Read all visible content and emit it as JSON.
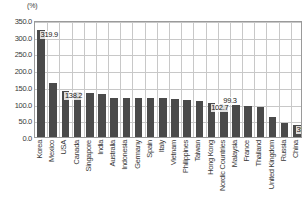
{
  "chart_data": {
    "type": "bar",
    "title": "",
    "subtitle": "",
    "xlabel": "",
    "ylabel": "(%)",
    "unit_label": "(%)",
    "ylim": [
      0.0,
      350.0
    ],
    "ytick_step": 50.0,
    "ytick_labels": [
      "350.0",
      "300.0",
      "250.0",
      "200.0",
      "150.0",
      "100.0",
      "50.0",
      "0.0"
    ],
    "ytick_values": [
      350.0,
      300.0,
      250.0,
      200.0,
      150.0,
      100.0,
      50.0,
      0.0
    ],
    "grid": true,
    "legend": "none",
    "bar_color": "#4a4a4a",
    "gridline_color": "#c8c8c8",
    "axis_color": "#9a9a9a",
    "categories": [
      "Korea",
      "Mexico",
      "USA",
      "Canada",
      "Singapore",
      "India",
      "Australia",
      "Indonesia",
      "Germany",
      "Spain",
      "Italy",
      "Vietnam",
      "Philippines",
      "Taiwan",
      "Hong Kong",
      "Nordic Countries",
      "Malaysia",
      "France",
      "Thailand",
      "United Kingdom",
      "Russia",
      "China"
    ],
    "values": [
      319.9,
      163.0,
      138.2,
      134.0,
      133.0,
      129.0,
      118.0,
      118.0,
      117.0,
      117.0,
      116.0,
      113.0,
      110.0,
      108.0,
      102.7,
      99.3,
      95.0,
      94.0,
      89.0,
      60.0,
      42.0,
      35.4
    ],
    "annotations": [
      {
        "category": "Korea",
        "value": 319.9,
        "text": "319.9"
      },
      {
        "category": "USA",
        "value": 138.2,
        "text": "138.2"
      },
      {
        "category": "Hong Kong",
        "value": 102.7,
        "text": "102.7"
      },
      {
        "category": "Nordic Countries",
        "value": 99.3,
        "text": "99.3"
      },
      {
        "category": "China",
        "value": 35.4,
        "text": "35.4"
      }
    ]
  }
}
